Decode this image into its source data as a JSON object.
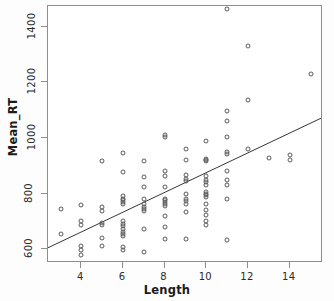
{
  "chart_data": {
    "type": "scatter",
    "title": "",
    "xlabel": "Length",
    "ylabel": "Mean_RT",
    "xlim": [
      2.4,
      15.6
    ],
    "ylim": [
      550,
      1475
    ],
    "xticks": [
      4,
      6,
      8,
      10,
      12,
      14
    ],
    "yticks": [
      600,
      800,
      1000,
      1200,
      1400
    ],
    "xtick_labels": [
      "4",
      "6",
      "8",
      "10",
      "12",
      "14"
    ],
    "ytick_labels": [
      "600",
      "800",
      "1000",
      "1200",
      "1400"
    ],
    "grid": false,
    "legend": null,
    "marker": "open-circle",
    "marker_color": "#5a5a5a",
    "trendline": {
      "type": "linear-fit",
      "color": "#333333",
      "x": [
        2.4,
        15.6
      ],
      "y": [
        598,
        1068
      ]
    },
    "points": [
      [
        3,
        745
      ],
      [
        3,
        655
      ],
      [
        4,
        760
      ],
      [
        4,
        700
      ],
      [
        4,
        688
      ],
      [
        4,
        612
      ],
      [
        4,
        598
      ],
      [
        4,
        578
      ],
      [
        5,
        918
      ],
      [
        5,
        752
      ],
      [
        5,
        738
      ],
      [
        5,
        695
      ],
      [
        5,
        688
      ],
      [
        5,
        640
      ],
      [
        5,
        612
      ],
      [
        6,
        945
      ],
      [
        6,
        878
      ],
      [
        6,
        790
      ],
      [
        6,
        782
      ],
      [
        6,
        775
      ],
      [
        6,
        770
      ],
      [
        6,
        762
      ],
      [
        6,
        700
      ],
      [
        6,
        692
      ],
      [
        6,
        682
      ],
      [
        6,
        672
      ],
      [
        6,
        662
      ],
      [
        6,
        655
      ],
      [
        6,
        648
      ],
      [
        6,
        608
      ],
      [
        6,
        598
      ],
      [
        7,
        918
      ],
      [
        7,
        858
      ],
      [
        7,
        822
      ],
      [
        7,
        782
      ],
      [
        7,
        762
      ],
      [
        7,
        752
      ],
      [
        7,
        745
      ],
      [
        7,
        738
      ],
      [
        7,
        672
      ],
      [
        7,
        590
      ],
      [
        8,
        1012
      ],
      [
        8,
        1002
      ],
      [
        8,
        880
      ],
      [
        8,
        862
      ],
      [
        8,
        822
      ],
      [
        8,
        782
      ],
      [
        8,
        775
      ],
      [
        8,
        768
      ],
      [
        8,
        762
      ],
      [
        8,
        755
      ],
      [
        8,
        718
      ],
      [
        8,
        680
      ],
      [
        8,
        635
      ],
      [
        9,
        960
      ],
      [
        9,
        920
      ],
      [
        9,
        868
      ],
      [
        9,
        852
      ],
      [
        9,
        845
      ],
      [
        9,
        800
      ],
      [
        9,
        782
      ],
      [
        9,
        772
      ],
      [
        9,
        762
      ],
      [
        9,
        732
      ],
      [
        9,
        638
      ],
      [
        10,
        990
      ],
      [
        10,
        925
      ],
      [
        10,
        922
      ],
      [
        10,
        918
      ],
      [
        10,
        862
      ],
      [
        10,
        850
      ],
      [
        10,
        840
      ],
      [
        10,
        830
      ],
      [
        10,
        805
      ],
      [
        10,
        800
      ],
      [
        10,
        795
      ],
      [
        10,
        788
      ],
      [
        10,
        762
      ],
      [
        10,
        742
      ],
      [
        10,
        722
      ],
      [
        10,
        700
      ],
      [
        10,
        688
      ],
      [
        11,
        1465
      ],
      [
        11,
        1098
      ],
      [
        11,
        1062
      ],
      [
        11,
        1002
      ],
      [
        11,
        950
      ],
      [
        11,
        942
      ],
      [
        11,
        880
      ],
      [
        11,
        848
      ],
      [
        11,
        832
      ],
      [
        11,
        782
      ],
      [
        11,
        632
      ],
      [
        12,
        1330
      ],
      [
        12,
        1135
      ],
      [
        12,
        960
      ],
      [
        13,
        928
      ],
      [
        14,
        940
      ],
      [
        14,
        920
      ],
      [
        15,
        1230
      ]
    ]
  },
  "axis": {
    "x_title": "Length",
    "y_title": "Mean_RT"
  }
}
